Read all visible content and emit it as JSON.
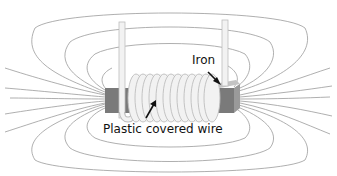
{
  "diagram": {
    "labels": {
      "iron": "Iron",
      "wire": "Plastic covered wire"
    },
    "colors": {
      "field_lines": "#888888",
      "iron_front": "#7a7a7a",
      "iron_top": "#c4c4c4",
      "iron_side": "#9a9a9a",
      "coil": "#f2f2f2",
      "coil_outline": "#bdbdbd",
      "arrow": "#111111"
    }
  }
}
